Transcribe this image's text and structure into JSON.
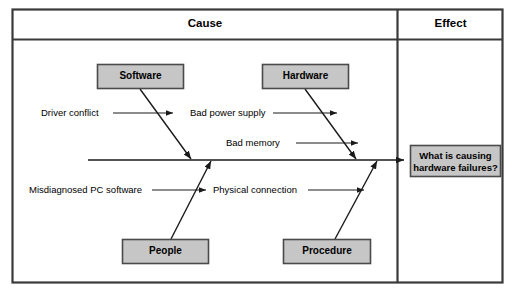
{
  "diagram": {
    "type": "fishbone-cause-and-effect",
    "headers": [
      {
        "id": "cause",
        "label": "Cause"
      },
      {
        "id": "effect",
        "label": "Effect"
      }
    ],
    "categories": [
      {
        "id": "software",
        "label": "Software",
        "position": "top-left"
      },
      {
        "id": "hardware",
        "label": "Hardware",
        "position": "top-right"
      },
      {
        "id": "people",
        "label": "People",
        "position": "bottom-left"
      },
      {
        "id": "procedure",
        "label": "Procedure",
        "position": "bottom-right"
      }
    ],
    "causes": [
      {
        "id": "driver-conflict",
        "label": "Driver conflict",
        "category": "software"
      },
      {
        "id": "bad-power-supply",
        "label": "Bad power supply",
        "category": "hardware"
      },
      {
        "id": "bad-memory",
        "label": "Bad memory",
        "category": "hardware"
      },
      {
        "id": "misdiagnosed-pc-software",
        "label": "Misdiagnosed PC software",
        "category": "people"
      },
      {
        "id": "physical-connection",
        "label": "Physical connection",
        "category": "procedure"
      }
    ],
    "effect": {
      "line1": "What is causing",
      "line2": "hardware failures?"
    },
    "colors": {
      "box_fill": "#c6c6c6",
      "box_stroke": "#4a4a4a",
      "frame_stroke": "#3a3a3a",
      "line": "#1a1a1a",
      "background": "#ffffff",
      "text": "#000000"
    }
  }
}
